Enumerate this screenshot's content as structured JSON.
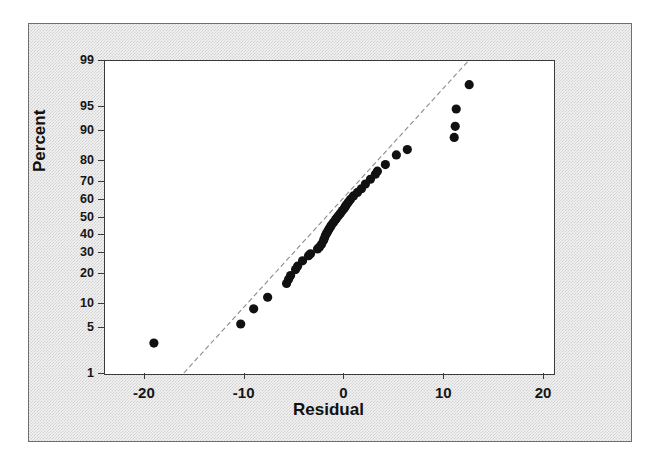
{
  "figure": {
    "kind": "normal-probability-plot",
    "background_color": "#f2f2f2",
    "plot_background_color": "#ffffff",
    "frame_color": "#3a3a3a",
    "marker_color": "#111111",
    "reference_line_color": "#8c8c8c"
  },
  "chart_data": {
    "type": "scatter",
    "title": "",
    "subtitle": "",
    "xlabel": "Residual",
    "ylabel": "Percent",
    "grid": false,
    "legend": null,
    "xlim": [
      -24,
      21
    ],
    "ylim_percent": [
      1,
      99
    ],
    "y_scale": "normal-probability",
    "xticks": [
      -20,
      -10,
      0,
      10,
      20
    ],
    "xtick_labels": [
      "-20",
      "-10",
      "0",
      "10",
      "20"
    ],
    "yticks": [
      1,
      5,
      10,
      20,
      30,
      40,
      50,
      60,
      70,
      80,
      90,
      95,
      99
    ],
    "ytick_labels": [
      "1",
      "5",
      "10",
      "20",
      "30",
      "40",
      "50",
      "60",
      "70",
      "80",
      "90",
      "95",
      "99"
    ],
    "reference_line": {
      "style": "dashed",
      "x_start": -16.0,
      "percent_start": 1.0,
      "x_end": 12.6,
      "percent_end": 99.0
    },
    "series": [
      {
        "name": "Residuals",
        "marker": "filled-circle",
        "n_points": 48,
        "x": [
          -19.0,
          -10.3,
          -9.0,
          -7.6,
          -5.7,
          -5.5,
          -5.3,
          -4.8,
          -4.6,
          -4.1,
          -3.5,
          -3.3,
          -2.6,
          -2.4,
          -2.2,
          -2.0,
          -1.9,
          -1.8,
          -1.7,
          -1.6,
          -1.5,
          -1.4,
          -1.3,
          -1.2,
          -1.0,
          -0.8,
          -0.7,
          -0.5,
          -0.3,
          -0.1,
          0.1,
          0.2,
          0.3,
          0.5,
          0.7,
          1.0,
          1.4,
          1.8,
          2.2,
          2.7,
          3.2,
          3.4,
          4.2,
          5.3,
          6.4,
          11.1,
          11.2,
          11.3,
          12.6
        ],
        "percent": [
          3.0,
          5.5,
          8.5,
          11.5,
          16.0,
          17.5,
          19.0,
          21.5,
          23.0,
          25.5,
          28.0,
          29.0,
          31.5,
          32.5,
          34.0,
          36.0,
          37.5,
          39.0,
          40.0,
          41.0,
          42.0,
          43.0,
          44.0,
          45.0,
          46.5,
          48.0,
          49.0,
          50.5,
          52.0,
          53.5,
          55.0,
          56.0,
          57.0,
          58.5,
          60.0,
          62.0,
          64.0,
          66.0,
          68.5,
          71.0,
          73.5,
          75.0,
          78.0,
          82.0,
          84.0,
          88.0,
          91.0,
          94.5,
          97.5
        ]
      }
    ]
  }
}
